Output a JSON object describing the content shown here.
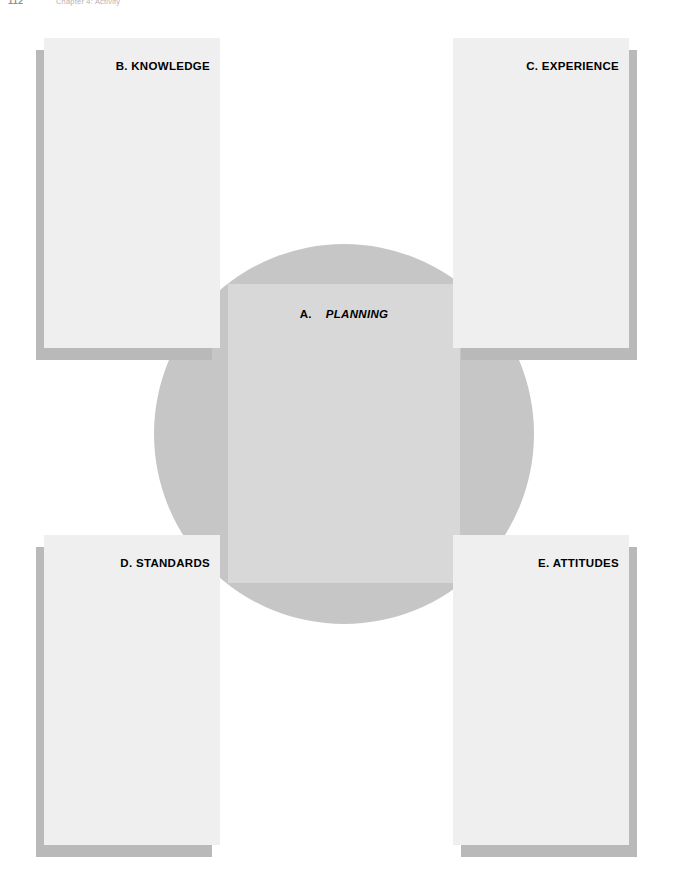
{
  "page": {
    "folio": "112",
    "running_head": "Chapter 4:  Activity"
  },
  "diagram": {
    "center": {
      "lead": "A.",
      "name": "PLANNING"
    },
    "cards": [
      {
        "id": "b",
        "lead": "B.",
        "name": "KNOWLEDGE",
        "label": "B.  KNOWLEDGE",
        "position": "top-left"
      },
      {
        "id": "c",
        "lead": "C.",
        "name": "EXPERIENCE",
        "label": "C.  EXPERIENCE",
        "position": "top-right"
      },
      {
        "id": "d",
        "lead": "D.",
        "name": "STANDARDS",
        "label": "D.  STANDARDS",
        "position": "bottom-left"
      },
      {
        "id": "e",
        "lead": "E.",
        "name": "ATTITUDES",
        "label": "E.  ATTITUDES",
        "position": "bottom-right"
      }
    ],
    "colors": {
      "page_background": "#ffffff",
      "circle_fill": "#c6c6c6",
      "band_fill": "#d8d8d8",
      "card_fill": "#efefef",
      "card_shadow": "#b9b9b9",
      "label_text": "#000000"
    }
  }
}
